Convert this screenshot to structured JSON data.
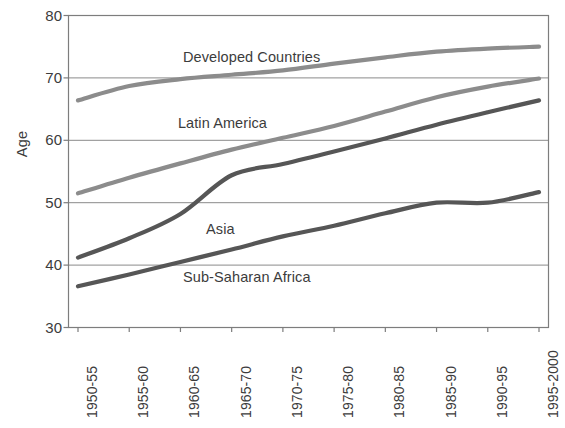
{
  "chart_data": {
    "type": "line",
    "title": "",
    "xlabel": "",
    "ylabel": "Age",
    "ylim": [
      30,
      80
    ],
    "ytick_values": [
      30,
      40,
      50,
      60,
      70,
      80
    ],
    "ytick_labels": [
      "30",
      "40",
      "50",
      "60",
      "70",
      "80"
    ],
    "grid": "horizontal",
    "legend_position": "inline-labels",
    "categories": [
      "1950-55",
      "1955-60",
      "1960-65",
      "1965-70",
      "1970-75",
      "1975-80",
      "1980-85",
      "1985-90",
      "1990-95",
      "1995-2000"
    ],
    "series": [
      {
        "name": "Developed Countries",
        "color": "#8c8c8c",
        "values": [
          66.4,
          68.7,
          69.8,
          70.5,
          71.2,
          72.3,
          73.3,
          74.2,
          74.7,
          75.0
        ]
      },
      {
        "name": "Latin America",
        "color": "#8c8c8c",
        "values": [
          51.5,
          54.0,
          56.3,
          58.5,
          60.4,
          62.3,
          64.6,
          66.9,
          68.6,
          69.9
        ]
      },
      {
        "name": "Asia",
        "color": "#565656",
        "values": [
          41.2,
          44.3,
          48.2,
          54.4,
          56.2,
          58.2,
          60.3,
          62.5,
          64.5,
          66.4
        ]
      },
      {
        "name": "Sub-Saharan Africa",
        "color": "#565656",
        "values": [
          36.6,
          38.5,
          40.5,
          42.5,
          44.6,
          46.3,
          48.3,
          50.0,
          50.0,
          51.7
        ]
      }
    ],
    "annotations": [
      {
        "text": "Developed Countries",
        "x": 2.05,
        "y": 73.2
      },
      {
        "text": "Latin America",
        "x": 1.95,
        "y": 62.6
      },
      {
        "text": "Asia",
        "x": 2.5,
        "y": 45.6
      },
      {
        "text": "Sub-Saharan Africa",
        "x": 2.05,
        "y": 38.0
      }
    ],
    "colors": {
      "frame": "#7d7d7d",
      "gridline": "#8a8a8a",
      "text": "#3c3c3c",
      "background": "#ffffff"
    }
  }
}
